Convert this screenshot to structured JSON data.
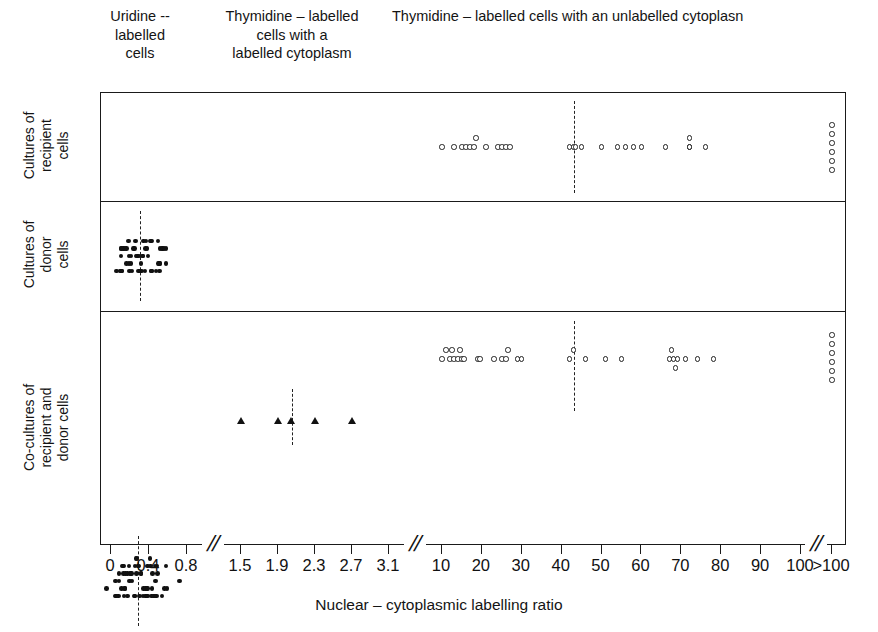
{
  "headers": {
    "uridine": "Uridine --\nlabelled\ncells",
    "thymidine_cytoplasm": "Thymidine – labelled\ncells with a\nlabelled cytoplasm",
    "thymidine_uncytoplasm": "Thymidine – labelled cells with an unlabelled cytoplasn"
  },
  "rows": [
    {
      "label": "Cultures of\nrecipient\ncells"
    },
    {
      "label": "Cultures of\ndonor\ncells"
    },
    {
      "label": "Co-cultures of\nrecipient and\ndonor cells"
    }
  ],
  "axis": {
    "title": "Nuclear – cytoplasmic labelling ratio",
    "break_glyph": "//",
    "ticks": [
      {
        "label": "0",
        "x": 10
      },
      {
        "label": "0.4",
        "x": 48
      },
      {
        "label": "0.8",
        "x": 86
      },
      {
        "label": "1.5",
        "x": 140
      },
      {
        "label": "1.9",
        "x": 177
      },
      {
        "label": "2.3",
        "x": 214
      },
      {
        "label": "2.7",
        "x": 251
      },
      {
        "label": "3.1",
        "x": 288
      },
      {
        "label": "10",
        "x": 341
      },
      {
        "label": "20",
        "x": 394
      },
      {
        "label": "30",
        "x": 447
      },
      {
        "label": "40",
        "x": 500
      },
      {
        "label": "50",
        "x": 553
      },
      {
        "label": "60",
        "x": 606
      },
      {
        "label": "70",
        "x": 659
      },
      {
        "label": "80",
        "x": 700
      },
      {
        "label": "90",
        "x": 672
      },
      {
        "label": "100",
        "x": 700
      },
      {
        "label": ">100",
        "x": 731
      }
    ],
    "breaks": [
      110,
      315,
      715
    ]
  },
  "chart_data": {
    "type": "scatter",
    "title": "",
    "xlabel": "Nuclear – cytoplasmic labelling ratio",
    "ylabel": "",
    "grid": false,
    "legend": "none",
    "axis_segments": [
      {
        "name": "low",
        "range": [
          0,
          0.8
        ],
        "note": "fine scale, ticks 0 / 0.4 / 0.8"
      },
      {
        "name": "mid",
        "range": [
          1.5,
          3.1
        ],
        "note": "ticks 1.5 / 1.9 / 2.3 / 2.7 / 3.1"
      },
      {
        "name": "high",
        "range": [
          10,
          100
        ],
        "note": "ticks every 10 up to 100"
      },
      {
        "name": "over",
        "range": [
          ">100"
        ],
        "note": "off-scale pile-up column"
      }
    ],
    "marker_legend": {
      "open-circle": "Thymidine – labelled cells with an unlabelled cytoplasm",
      "filled-circle": "Uridine – labelled cells",
      "filled-triangle": "Thymidine – labelled cells with a labelled cytoplasm"
    },
    "panels": [
      {
        "name": "Cultures of recipient cells",
        "medians": [
          {
            "marker": "open-circle",
            "value": 43
          }
        ],
        "series": [
          {
            "name": "Thymidine – labelled cells with an unlabelled cytoplasm",
            "marker": "open-circle",
            "values": [
              10,
              13,
              15,
              16,
              17,
              18,
              18.5,
              21,
              24,
              25,
              26,
              27,
              42,
              43,
              43.5,
              45,
              50,
              54,
              56,
              58,
              60,
              66,
              72,
              72,
              76,
              100,
              100,
              100,
              100,
              100,
              100
            ],
            "over_100_count": 6
          }
        ]
      },
      {
        "name": "Cultures of donor cells",
        "medians": [
          {
            "marker": "filled-circle",
            "value": 0.31
          }
        ],
        "series": [
          {
            "name": "Uridine – labelled cells",
            "marker": "filled-circle",
            "count": 52,
            "range": [
              0.05,
              0.62
            ],
            "center": 0.31
          }
        ]
      },
      {
        "name": "Co-cultures of recipient and donor cells",
        "medians": [
          {
            "marker": "filled-circle",
            "value": 0.28
          },
          {
            "marker": "filled-triangle",
            "value": 2.05
          },
          {
            "marker": "open-circle",
            "value": 43
          }
        ],
        "series": [
          {
            "name": "Uridine – labelled cells",
            "marker": "filled-circle",
            "count": 60,
            "range": [
              0.02,
              0.78
            ],
            "center": 0.28
          },
          {
            "name": "Thymidine – labelled cells with a labelled cytoplasm",
            "marker": "filled-triangle",
            "values": [
              1.5,
              1.9,
              2.05,
              2.3,
              2.7
            ]
          },
          {
            "name": "Thymidine – labelled cells with an unlabelled cytoplasm",
            "marker": "open-circle",
            "values": [
              10,
              11,
              12,
              12.5,
              13,
              14,
              14.5,
              15,
              15.5,
              19,
              19.5,
              23,
              25,
              26,
              26.5,
              29,
              30,
              42,
              43,
              46,
              51,
              55,
              67,
              67.5,
              68,
              68.5,
              69,
              71,
              74,
              78,
              100,
              100,
              100,
              100,
              100,
              100
            ],
            "over_100_count": 6
          }
        ]
      }
    ]
  }
}
